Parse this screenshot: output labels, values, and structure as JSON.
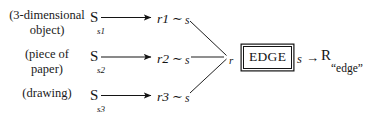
{
  "figure": {
    "type": "semiotic-mapping-diagram",
    "background_color": "#ffffff",
    "ink_color": "#141414"
  },
  "rows": [
    {
      "descriptor_line1": "(3-dimensional",
      "descriptor_line2": "object)",
      "source_symbol": "S",
      "source_subscript": "s",
      "source_subscript_index": "1",
      "arrow": "→",
      "target_symbol": "r",
      "target_index": "1",
      "relation": "∼",
      "sign_symbol": "s"
    },
    {
      "descriptor_line1": "(piece of",
      "descriptor_line2": "paper)",
      "source_symbol": "S",
      "source_subscript": "s",
      "source_subscript_index": "2",
      "arrow": "→",
      "target_symbol": "r",
      "target_index": "2",
      "relation": "∼",
      "sign_symbol": "s"
    },
    {
      "descriptor_line1": "(drawing)",
      "descriptor_line2": "",
      "source_symbol": "S",
      "source_subscript": "s",
      "source_subscript_index": "3",
      "arrow": "→",
      "target_symbol": "r",
      "target_index": "3",
      "relation": "∼",
      "sign_symbol": "s"
    }
  ],
  "convergence": {
    "referent_label": "r"
  },
  "edge_box": {
    "label": "EDGE"
  },
  "rhs": {
    "sign": "s",
    "arrow": "→",
    "representation": "R",
    "subscript_quoted": "“edge”"
  }
}
